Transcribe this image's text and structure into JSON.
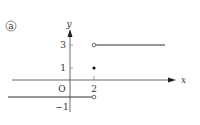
{
  "figure": {
    "label": "ⓐ",
    "axes": {
      "x_label": "x",
      "y_label": "y",
      "origin_label": "O",
      "x_ticks": [
        {
          "value": 2,
          "label": "2"
        }
      ],
      "y_ticks": [
        {
          "value": 3,
          "label": "3"
        },
        {
          "value": 1,
          "label": "1"
        },
        {
          "value": -1,
          "label": "−1"
        }
      ]
    },
    "pieces": [
      {
        "from": "-inf",
        "to": 2,
        "y": -0.7,
        "right_endpoint": "open"
      },
      {
        "at": 2,
        "y": 1,
        "point": "closed"
      },
      {
        "from": 2,
        "to": "inf",
        "y": 3,
        "left_endpoint": "open"
      }
    ],
    "colors": {
      "ink": "#333333"
    }
  }
}
